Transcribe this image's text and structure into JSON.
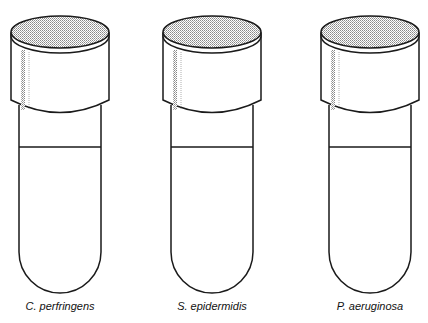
{
  "tubes": [
    {
      "label": "C. perfringens",
      "center_x": 60
    },
    {
      "label": "S. epidermidis",
      "center_x": 212
    },
    {
      "label": "P. aeruginosa",
      "center_x": 370
    }
  ],
  "colors": {
    "stroke": "#1a1a1a",
    "cap_top": "#bdbdbd",
    "background": "#ffffff"
  }
}
